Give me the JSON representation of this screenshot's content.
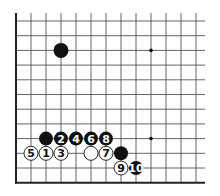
{
  "diagram": {
    "type": "go-board-corner",
    "grid": {
      "x0": 16,
      "y0": 21,
      "spacing_x": 15,
      "spacing_y": 14.7,
      "cols": 13,
      "rows": 12,
      "line_color": "#555555",
      "edge_color": "#222222",
      "line_extend_top": 13,
      "line_extend_right": 205
    },
    "star_points": [
      {
        "col": 9,
        "row": 2
      },
      {
        "col": 9,
        "row": 8
      }
    ],
    "stones": [
      {
        "col": 3,
        "row": 2,
        "color": "black",
        "label": "",
        "big": true
      },
      {
        "col": 2,
        "row": 8,
        "color": "black",
        "label": ""
      },
      {
        "col": 3,
        "row": 8,
        "color": "black",
        "label": "2"
      },
      {
        "col": 4,
        "row": 8,
        "color": "black",
        "label": "4"
      },
      {
        "col": 5,
        "row": 8,
        "color": "black",
        "label": "6"
      },
      {
        "col": 6,
        "row": 8,
        "color": "black",
        "label": "8"
      },
      {
        "col": 1,
        "row": 9,
        "color": "white",
        "label": "5"
      },
      {
        "col": 2,
        "row": 9,
        "color": "white",
        "label": "1"
      },
      {
        "col": 3,
        "row": 9,
        "color": "white",
        "label": "3"
      },
      {
        "col": 5,
        "row": 9,
        "color": "white",
        "label": ""
      },
      {
        "col": 6,
        "row": 9,
        "color": "white",
        "label": "7"
      },
      {
        "col": 7,
        "row": 9,
        "color": "black",
        "label": ""
      },
      {
        "col": 7,
        "row": 10,
        "color": "white",
        "label": "9"
      },
      {
        "col": 8,
        "row": 10,
        "color": "black",
        "label": "10"
      }
    ]
  }
}
